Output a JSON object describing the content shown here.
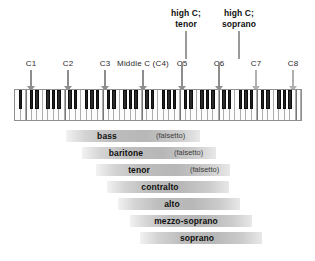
{
  "diagram": {
    "callouts": [
      {
        "name": "high-c-tenor",
        "line1": "high C;",
        "line2": "tenor",
        "x": 186,
        "label_top": 8,
        "stem_top": 31,
        "stem_height": 28
      },
      {
        "name": "high-c-soprano",
        "line1": "high C;",
        "line2": "soprano",
        "x": 239,
        "label_top": 8,
        "stem_top": 31,
        "stem_height": 28
      }
    ],
    "octave_markers": [
      {
        "label": "C1",
        "x": 31,
        "label_width": 16,
        "arrow_top": 70,
        "arrow_height": 21,
        "dark": true
      },
      {
        "label": "C2",
        "x": 68,
        "label_width": 16,
        "arrow_top": 70,
        "arrow_height": 21,
        "dark": true
      },
      {
        "label": "C3",
        "x": 105,
        "label_width": 16,
        "arrow_top": 70,
        "arrow_height": 21,
        "dark": true
      },
      {
        "label": "Middle C (C4)",
        "x": 143,
        "label_width": 62,
        "arrow_top": 70,
        "arrow_height": 21,
        "dark": true
      },
      {
        "label": "C5",
        "x": 182,
        "label_width": 16,
        "arrow_top": 62,
        "arrow_height": 29,
        "dark": true
      },
      {
        "label": "C6",
        "x": 219,
        "label_width": 16,
        "arrow_top": 62,
        "arrow_height": 29,
        "dark": true
      },
      {
        "label": "C7",
        "x": 256,
        "label_width": 16,
        "arrow_top": 70,
        "arrow_height": 21,
        "dark": false
      },
      {
        "label": "C8",
        "x": 293,
        "label_width": 16,
        "arrow_top": 70,
        "arrow_height": 21,
        "dark": false
      }
    ],
    "octave_label_top": 59,
    "keyboard": {
      "name": "piano-keyboard",
      "left": 14,
      "top": 89,
      "width": 288,
      "height": 32,
      "white_key_count": 52,
      "lowest_key": "A0",
      "highest_key": "C8",
      "octave_boundaries_at": [
        "C1",
        "C2",
        "C3",
        "C4",
        "C5",
        "C6",
        "C7",
        "C8"
      ]
    },
    "ranges": [
      {
        "name": "bass",
        "label": "bass",
        "note": "(falsetto)",
        "left": 66,
        "width": 134,
        "top": 130,
        "label_center": 107,
        "note_x": 156
      },
      {
        "name": "baritone",
        "label": "baritone",
        "note": "(falsetto)",
        "left": 82,
        "width": 134,
        "top": 147,
        "label_center": 126,
        "note_x": 174
      },
      {
        "name": "tenor",
        "label": "tenor",
        "note": "(falsetto)",
        "left": 96,
        "width": 134,
        "top": 164,
        "label_center": 139,
        "note_x": 190
      },
      {
        "name": "contralto",
        "label": "contralto",
        "note": "",
        "left": 107,
        "width": 122,
        "top": 181,
        "label_center": 160,
        "note_x": 0
      },
      {
        "name": "alto",
        "label": "alto",
        "note": "",
        "left": 118,
        "width": 122,
        "top": 198,
        "label_center": 172,
        "note_x": 0
      },
      {
        "name": "mezzo-soprano",
        "label": "mezzo-soprano",
        "note": "",
        "left": 130,
        "width": 122,
        "top": 215,
        "label_center": 186,
        "note_x": 0
      },
      {
        "name": "soprano",
        "label": "soprano",
        "note": "",
        "left": 140,
        "width": 122,
        "top": 232,
        "label_center": 197,
        "note_x": 0
      }
    ],
    "colors": {
      "bar_light": "#f2f2f2",
      "bar_dark": "#b7b7b7",
      "arrow": "#b0b0b0",
      "arrow_dark": "#8d8d8d",
      "text": "#101010",
      "white_key": "#fdfdfd",
      "black_key": "#1c1c1c"
    }
  }
}
